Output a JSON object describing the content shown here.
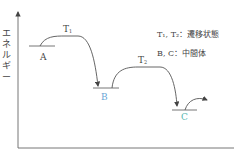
{
  "diagram": {
    "type": "energy-profile",
    "y_axis_label": "エネルギー",
    "levels": [
      {
        "id": "A",
        "label": "A",
        "color": "#555555"
      },
      {
        "id": "B",
        "label": "B",
        "color": "#6aa6d6"
      },
      {
        "id": "C",
        "label": "C",
        "color": "#5ab8b0"
      }
    ],
    "transition_states": [
      {
        "id": "T1",
        "base": "T",
        "sub": "1"
      },
      {
        "id": "T2",
        "base": "T",
        "sub": "2"
      }
    ],
    "legend": {
      "line1": "T₁, T₂：遷移状態",
      "line2": "B, C：中間体"
    }
  }
}
